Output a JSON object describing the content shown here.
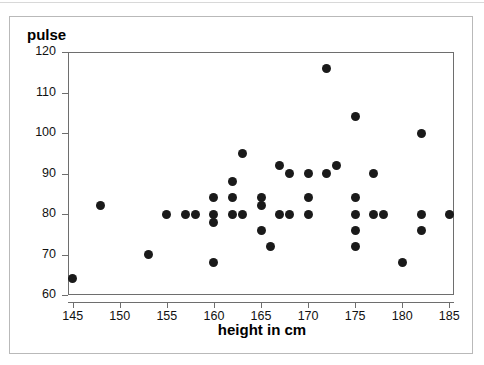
{
  "chart_data": {
    "type": "scatter",
    "title": "",
    "xlabel": "height in cm",
    "ylabel": "pulse",
    "xlim": [
      144.5,
      185.5
    ],
    "ylim": [
      60,
      120
    ],
    "grid": false,
    "legend": null,
    "x_ticks": [
      145,
      150,
      155,
      160,
      165,
      170,
      175,
      180,
      185
    ],
    "y_ticks": [
      60,
      70,
      80,
      90,
      100,
      110,
      120
    ],
    "marker": {
      "shape": "circle",
      "color": "#1a1a1a",
      "size_px": 9
    },
    "points": [
      {
        "x": 145,
        "y": 64
      },
      {
        "x": 148,
        "y": 82
      },
      {
        "x": 153,
        "y": 70
      },
      {
        "x": 155,
        "y": 80
      },
      {
        "x": 157,
        "y": 80
      },
      {
        "x": 158,
        "y": 80
      },
      {
        "x": 160,
        "y": 84
      },
      {
        "x": 160,
        "y": 80
      },
      {
        "x": 160,
        "y": 78
      },
      {
        "x": 160,
        "y": 68
      },
      {
        "x": 162,
        "y": 88
      },
      {
        "x": 162,
        "y": 84
      },
      {
        "x": 162,
        "y": 80
      },
      {
        "x": 163,
        "y": 95
      },
      {
        "x": 163,
        "y": 80
      },
      {
        "x": 165,
        "y": 84
      },
      {
        "x": 165,
        "y": 82
      },
      {
        "x": 165,
        "y": 76
      },
      {
        "x": 166,
        "y": 72
      },
      {
        "x": 167,
        "y": 92
      },
      {
        "x": 167,
        "y": 80
      },
      {
        "x": 168,
        "y": 90
      },
      {
        "x": 168,
        "y": 80
      },
      {
        "x": 170,
        "y": 90
      },
      {
        "x": 170,
        "y": 84
      },
      {
        "x": 170,
        "y": 80
      },
      {
        "x": 172,
        "y": 116
      },
      {
        "x": 172,
        "y": 90
      },
      {
        "x": 173,
        "y": 92
      },
      {
        "x": 175,
        "y": 104
      },
      {
        "x": 175,
        "y": 84
      },
      {
        "x": 175,
        "y": 80
      },
      {
        "x": 175,
        "y": 76
      },
      {
        "x": 175,
        "y": 72
      },
      {
        "x": 177,
        "y": 90
      },
      {
        "x": 177,
        "y": 80
      },
      {
        "x": 178,
        "y": 80
      },
      {
        "x": 180,
        "y": 68
      },
      {
        "x": 182,
        "y": 100
      },
      {
        "x": 182,
        "y": 80
      },
      {
        "x": 182,
        "y": 76
      },
      {
        "x": 185,
        "y": 80
      }
    ]
  },
  "axes": {
    "y_title": "pulse",
    "x_title": "height in cm"
  }
}
